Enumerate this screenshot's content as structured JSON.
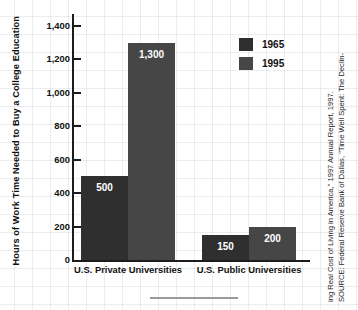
{
  "chart_data": {
    "type": "bar",
    "title": "",
    "xlabel": "",
    "ylabel": "Hours of Work Time Needed to Buy a College Education",
    "categories": [
      "U.S. Private Universities",
      "U.S. Public Universities"
    ],
    "series": [
      {
        "name": "1965",
        "values": [
          500,
          150
        ],
        "color": "#2f2f2f"
      },
      {
        "name": "1995",
        "values": [
          1300,
          200
        ],
        "color": "#464646"
      }
    ],
    "value_labels": [
      "500",
      "1,300",
      "150",
      "200"
    ],
    "ylim": [
      0,
      1400
    ],
    "yticks": [
      0,
      200,
      400,
      600,
      800,
      1000,
      1200,
      1400
    ],
    "ytick_labels": [
      "0",
      "200",
      "400",
      "600",
      "800",
      "1,000",
      "1,200",
      "1,400"
    ],
    "grid": true,
    "legend_position": "upper right"
  },
  "legend": {
    "entries": [
      {
        "label": "1965",
        "color": "#2f2f2f"
      },
      {
        "label": "1995",
        "color": "#464646"
      }
    ]
  },
  "source": {
    "line1": "SOURCE: Federal Reserve Bank of Dallas, \"Time Well Spent: The Declin-",
    "line2": "ing Real Cost of Living in America,\" 1997 Annual Report, 1997."
  }
}
